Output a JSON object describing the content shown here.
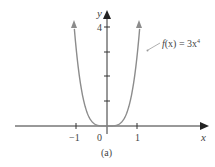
{
  "chart_data": {
    "type": "line",
    "title": "",
    "caption": "(a)",
    "function_label": "f(x) = 3x⁴",
    "xlabel": "x",
    "ylabel": "y",
    "x_ticks": [
      -1,
      0,
      1
    ],
    "x_tick_labels": [
      "−1",
      "0",
      "1"
    ],
    "y_ticks": [
      1,
      2,
      3,
      4
    ],
    "y_tick_labels": [
      "",
      "",
      "",
      "4"
    ],
    "xlim": [
      -2.0,
      2.1
    ],
    "ylim": [
      0,
      4.6
    ],
    "grid": false,
    "legend": "annotation pointing to right branch",
    "series": [
      {
        "name": "f(x) = 3x^4",
        "expression": "3*x^4",
        "x": [
          -1.07,
          -1.0,
          -0.9,
          -0.8,
          -0.7,
          -0.6,
          -0.5,
          -0.4,
          -0.3,
          -0.2,
          0,
          0.2,
          0.3,
          0.4,
          0.5,
          0.6,
          0.7,
          0.8,
          0.9,
          1.0,
          1.07
        ],
        "values": [
          3.93,
          3.0,
          1.97,
          1.23,
          0.72,
          0.39,
          0.19,
          0.08,
          0.02,
          0.0,
          0,
          0.0,
          0.02,
          0.08,
          0.19,
          0.39,
          0.72,
          1.23,
          1.97,
          3.0,
          3.93
        ]
      }
    ]
  },
  "labels": {
    "x_axis": "x",
    "y_axis": "y",
    "y_tick_4": "4",
    "x_tick_neg1": "−1",
    "x_tick_0": "0",
    "x_tick_1": "1",
    "caption": "(a)",
    "func_prefix": "f",
    "func_arg": "(x) = 3x",
    "func_exp": "4"
  },
  "colors": {
    "axis": "#333333",
    "curve": "#8c8c8c",
    "text": "#444444"
  }
}
